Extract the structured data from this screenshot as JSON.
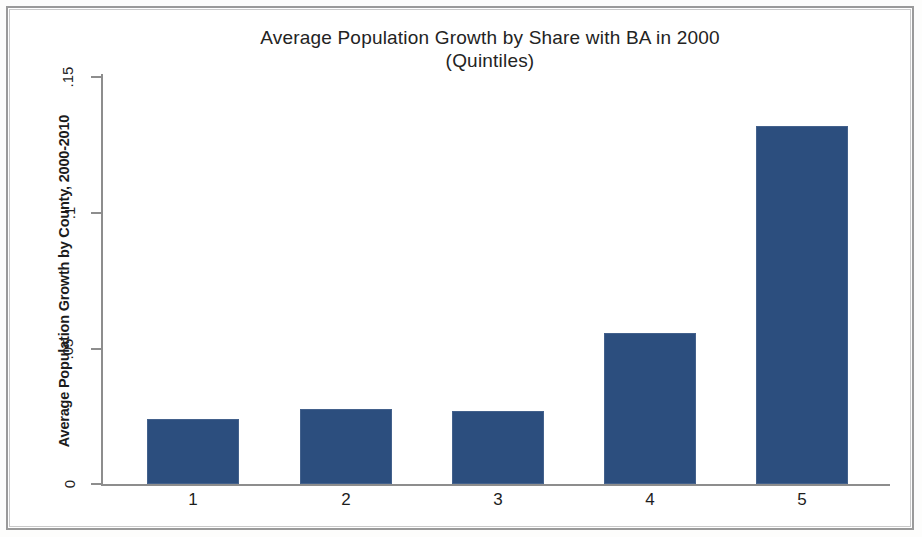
{
  "chart_data": {
    "type": "bar",
    "title": "Average Population Growth by Share with BA in 2000",
    "subtitle": "(Quintiles)",
    "xlabel": "",
    "ylabel": "Average Population Growth by County, 2000-2010",
    "categories": [
      "1",
      "2",
      "3",
      "4",
      "5"
    ],
    "values": [
      0.024,
      0.0275,
      0.0268,
      0.0555,
      0.1315
    ],
    "ylim": [
      0,
      0.15
    ],
    "yticks": [
      0,
      0.05,
      0.1,
      0.15
    ],
    "ytick_labels": [
      "0",
      ".05",
      ".1",
      ".15"
    ],
    "grid": false,
    "legend": null,
    "series": [
      {
        "name": "Average Population Growth by County, 2000-2010",
        "values": [
          0.024,
          0.0275,
          0.0268,
          0.0555,
          0.1315
        ],
        "color": "#2c4e7e"
      }
    ],
    "bar_color": "#2c4e7e",
    "background_color": "#ffffff",
    "axis_color": "#8d8d8d"
  },
  "chart": {
    "title_line1": "Average Population Growth by Share with BA in 2000",
    "title_line2": "(Quintiles)",
    "y_axis_label": "Average Population Growth by County, 2000-2010",
    "y_tick_labels": [
      ".15",
      ".1",
      ".05",
      "0"
    ],
    "x_tick_labels": [
      "1",
      "2",
      "3",
      "4",
      "5"
    ]
  }
}
